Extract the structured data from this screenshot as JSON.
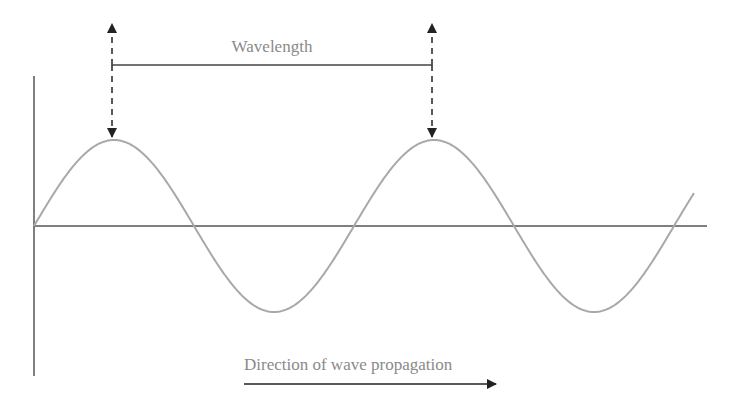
{
  "diagram": {
    "labels": {
      "wavelength": "Wavelength",
      "direction": "Direction of wave propagation"
    },
    "colors": {
      "wave": "#a8a8a8",
      "axes": "#555555",
      "markers": "#222222",
      "text": "#8a8a8a"
    },
    "axes": {
      "origin": {
        "x": 34,
        "y": 226
      },
      "vertical": {
        "x": 34,
        "y_top": 76,
        "y_bottom": 376
      },
      "horizontal": {
        "y": 226,
        "x_start": 34,
        "x_end": 707
      }
    },
    "wave": {
      "start_x": 34,
      "end_x": 694,
      "baseline_y": 226,
      "amplitude_px": 86,
      "period_px": 320,
      "peaks_x": [
        114,
        434
      ],
      "troughs_x": [
        274,
        594
      ],
      "zero_crossings_x": [
        34,
        194,
        354,
        514,
        674
      ]
    },
    "wavelength_marker": {
      "left_x": 112,
      "right_x": 432,
      "bar_y": 65,
      "arrow_top_y": 23,
      "arrow_bottom_y": 138
    },
    "propagation_arrow": {
      "x_start": 244,
      "x_end": 497,
      "y": 384
    }
  }
}
